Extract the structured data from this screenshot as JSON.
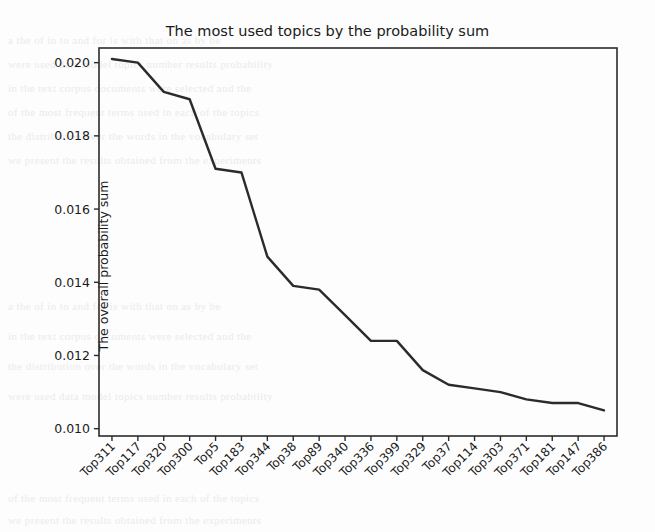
{
  "chart_data": {
    "type": "line",
    "title": "The most used topics by the probability sum",
    "xlabel": "",
    "ylabel": "The overall probability sum",
    "categories": [
      "Top311",
      "Top117",
      "Top320",
      "Top300",
      "Top5",
      "Top183",
      "Top344",
      "Top38",
      "Top89",
      "Top340",
      "Top336",
      "Top399",
      "Top329",
      "Top37",
      "Top114",
      "Top303",
      "Top371",
      "Top181",
      "Top147",
      "Top386"
    ],
    "values": [
      0.0201,
      0.02,
      0.0192,
      0.019,
      0.0171,
      0.017,
      0.0147,
      0.0139,
      0.0138,
      0.0131,
      0.0124,
      0.0124,
      0.0116,
      0.0112,
      0.0111,
      0.011,
      0.0108,
      0.0107,
      0.0107,
      0.0105
    ],
    "yticks": [
      "0.010",
      "0.012",
      "0.014",
      "0.016",
      "0.018",
      "0.020"
    ],
    "ytick_values": [
      0.01,
      0.012,
      0.014,
      0.016,
      0.018,
      0.02
    ],
    "ylim": [
      0.0098,
      0.0204
    ],
    "grid": false,
    "legend": null,
    "line_color": "#2b2b2b"
  },
  "background_text": [
    "a  the  of  in  to  and  for  is  with  that  on  as  by  be",
    "were  used  data  model  topics  number  results  probability",
    "in  the  text  corpus  documents  were  selected  and  the",
    "of  the  most  frequent  terms  used  in  each  of  the  topics",
    "the  distribution  over  the  words  in  the  vocabulary  set",
    "we  present  the  results  obtained  from  the  experiments"
  ]
}
